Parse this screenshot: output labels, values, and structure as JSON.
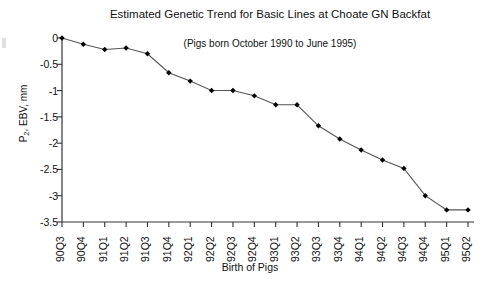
{
  "chart_data": {
    "type": "line",
    "title": "Estimated Genetic Trend for Basic Lines at Choate GN Backfat",
    "subtitle": "(Pigs born October 1990 to June 1995)",
    "xlabel": "Birth of Pigs",
    "ylabel": "P2, EBV, mm",
    "ylabel_base": "P",
    "ylabel_sub": "2",
    "ylabel_rest": ", EBV, mm",
    "categories": [
      "90Q3",
      "90Q4",
      "91Q1",
      "91Q2",
      "91Q3",
      "91Q4",
      "92Q1",
      "92Q2",
      "92Q3",
      "92Q4",
      "93Q1",
      "93Q2",
      "93Q3",
      "93Q4",
      "94Q1",
      "94Q2",
      "94Q3",
      "94Q4",
      "95Q1",
      "95Q2"
    ],
    "values": [
      0,
      -0.12,
      -0.22,
      -0.19,
      -0.3,
      -0.66,
      -0.82,
      -1.0,
      -1.0,
      -1.1,
      -1.27,
      -1.27,
      -1.67,
      -1.92,
      -2.13,
      -2.32,
      -2.48,
      -3.0,
      -3.27,
      -3.27
    ],
    "ylim": [
      -3.5,
      0
    ],
    "yticks": [
      0,
      -0.5,
      -1,
      -1.5,
      -2,
      -2.5,
      -3,
      -3.5
    ],
    "ytick_labels": [
      "0",
      "-0.5",
      "-1",
      "-1.5",
      "-2",
      "-2.5",
      "-3",
      "-3.5"
    ],
    "grid": false,
    "legend": null,
    "series_color": "#000000",
    "marker": "diamond",
    "line_color": "#555555"
  }
}
